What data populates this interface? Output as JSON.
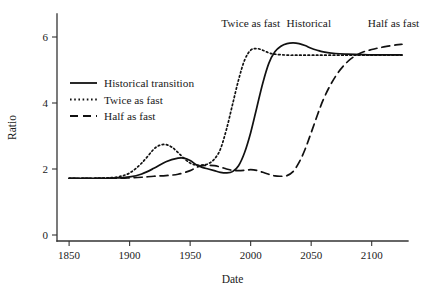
{
  "chart_data": {
    "type": "line",
    "title": "",
    "xlabel": "Date",
    "ylabel": "Ratio",
    "xlim": [
      1840,
      2130
    ],
    "ylim": [
      0,
      6.9
    ],
    "grid": false,
    "legend_position": "upper left",
    "xticks": [
      1850,
      1900,
      1950,
      2000,
      2050,
      2100
    ],
    "xtick_labels": [
      "1850",
      "1900",
      "1950",
      "2000",
      "2050",
      "2100"
    ],
    "yticks": [
      0,
      2,
      4,
      6
    ],
    "ytick_labels": [
      "0",
      "2",
      "4",
      "6"
    ],
    "series": [
      {
        "name": "Historical transition",
        "style": "solid",
        "color": "#111111",
        "x": [
          1850,
          1860,
          1870,
          1880,
          1890,
          1900,
          1910,
          1920,
          1930,
          1940,
          1945,
          1950,
          1955,
          1960,
          1965,
          1970,
          1975,
          1980,
          1985,
          1990,
          1995,
          2000,
          2005,
          2010,
          2015,
          2020,
          2025,
          2030,
          2035,
          2040,
          2045,
          2050,
          2055,
          2060,
          2070,
          2080,
          2090,
          2100,
          2110,
          2120,
          2125
        ],
        "y": [
          1.72,
          1.72,
          1.72,
          1.72,
          1.73,
          1.76,
          1.85,
          2.02,
          2.22,
          2.33,
          2.33,
          2.26,
          2.13,
          2.05,
          2.0,
          1.95,
          1.9,
          1.88,
          1.92,
          2.1,
          2.5,
          3.1,
          3.85,
          4.6,
          5.2,
          5.55,
          5.72,
          5.8,
          5.82,
          5.8,
          5.74,
          5.66,
          5.6,
          5.55,
          5.5,
          5.48,
          5.47,
          5.46,
          5.46,
          5.46,
          5.46
        ]
      },
      {
        "name": "Twice as fast",
        "style": "dotted",
        "color": "#111111",
        "x": [
          1850,
          1860,
          1870,
          1880,
          1890,
          1900,
          1910,
          1920,
          1925,
          1930,
          1935,
          1940,
          1945,
          1950,
          1955,
          1960,
          1965,
          1970,
          1975,
          1980,
          1985,
          1990,
          1995,
          2000,
          2005,
          2010,
          2015,
          2020,
          2030,
          2040,
          2050,
          2060,
          2080,
          2100,
          2120,
          2125
        ],
        "y": [
          1.72,
          1.72,
          1.72,
          1.73,
          1.76,
          1.88,
          2.18,
          2.6,
          2.72,
          2.74,
          2.66,
          2.5,
          2.32,
          2.18,
          2.12,
          2.12,
          2.16,
          2.3,
          2.6,
          3.2,
          3.95,
          4.7,
          5.3,
          5.6,
          5.65,
          5.6,
          5.52,
          5.48,
          5.45,
          5.45,
          5.45,
          5.45,
          5.45,
          5.45,
          5.45,
          5.45
        ]
      },
      {
        "name": "Half as fast",
        "style": "dashed",
        "color": "#111111",
        "x": [
          1850,
          1870,
          1890,
          1900,
          1910,
          1920,
          1930,
          1940,
          1950,
          1955,
          1960,
          1965,
          1970,
          1975,
          1980,
          1985,
          1990,
          1995,
          2000,
          2005,
          2010,
          2015,
          2020,
          2025,
          2030,
          2035,
          2040,
          2045,
          2050,
          2060,
          2070,
          2080,
          2090,
          2100,
          2110,
          2120,
          2125
        ],
        "y": [
          1.72,
          1.72,
          1.72,
          1.73,
          1.75,
          1.78,
          1.8,
          1.84,
          1.95,
          2.05,
          2.1,
          2.11,
          2.1,
          2.06,
          2.0,
          1.96,
          1.95,
          1.96,
          1.98,
          1.96,
          1.9,
          1.84,
          1.79,
          1.78,
          1.8,
          1.92,
          2.2,
          2.6,
          3.1,
          4.1,
          4.8,
          5.25,
          5.5,
          5.62,
          5.7,
          5.76,
          5.78
        ]
      }
    ],
    "legend": [
      {
        "label": "Historical transition",
        "style": "solid"
      },
      {
        "label": "Twice as fast",
        "style": "dotted"
      },
      {
        "label": "Half as fast",
        "style": "dashed"
      }
    ],
    "annotations": [
      {
        "text": "Twice as fast",
        "x": 2000,
        "y": 6.3
      },
      {
        "text": "Historical",
        "x": 2048,
        "y": 6.3
      },
      {
        "text": "Half as fast",
        "x": 2118,
        "y": 6.3
      }
    ]
  }
}
